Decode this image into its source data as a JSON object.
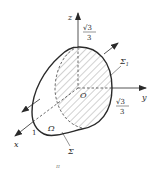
{
  "figure": {
    "type": "3d-surface-diagram",
    "colors": {
      "stroke": "#2a2a2a",
      "hatch": "#7a7a7a",
      "background": "#ffffff"
    },
    "axes": {
      "z_label": "z",
      "y_label": "y",
      "x_label": "x",
      "origin_label": "O"
    },
    "annotations": {
      "z_intercept": {
        "numerator": "√3",
        "denominator": "3"
      },
      "y_intercept": {
        "numerator": "√3",
        "denominator": "3"
      },
      "x_intercept": "1",
      "surface_sigma1": "Σ",
      "surface_sigma1_sub": "1",
      "surface_sigma": "Σ",
      "region_omega": "Ω",
      "caption_fragment": "π"
    }
  }
}
